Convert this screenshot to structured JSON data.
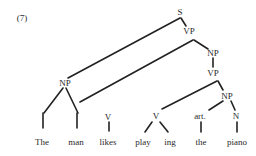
{
  "figure": {
    "number_label": "(7)",
    "ink_color": "#222222"
  },
  "nodes": {
    "s": {
      "label": "S",
      "x": 180,
      "y": 12
    },
    "vp1": {
      "label": "VP",
      "x": 189,
      "y": 31
    },
    "np1": {
      "label": "NP",
      "x": 213,
      "y": 53
    },
    "vp2": {
      "label": "VP",
      "x": 213,
      "y": 73
    },
    "np_subject": {
      "label": "NP",
      "x": 65,
      "y": 83
    },
    "v_likes": {
      "label": "V",
      "x": 108,
      "y": 117
    },
    "v_play": {
      "label": "V",
      "x": 156,
      "y": 116
    },
    "np2": {
      "label": "NP",
      "x": 227,
      "y": 96
    },
    "art": {
      "label": "art.",
      "x": 200,
      "y": 116
    },
    "n": {
      "label": "N",
      "x": 236,
      "y": 116
    }
  },
  "words": {
    "the_1": {
      "label": "The",
      "x": 42,
      "y": 142
    },
    "man": {
      "label": "man",
      "x": 76,
      "y": 142
    },
    "likes": {
      "label": "likes",
      "x": 108,
      "y": 142
    },
    "play": {
      "label": "play",
      "x": 143,
      "y": 142
    },
    "ing": {
      "label": "ing",
      "x": 170,
      "y": 142
    },
    "the_2": {
      "label": "the",
      "x": 201,
      "y": 142
    },
    "piano": {
      "label": "piano",
      "x": 237,
      "y": 142
    }
  },
  "edges": [
    {
      "from": "S",
      "to": "NP (subject)",
      "x1": 180,
      "y1": 18,
      "x2": 68,
      "y2": 78
    },
    {
      "from": "S",
      "to": "VP",
      "x1": 181,
      "y1": 18,
      "x2": 186,
      "y2": 26
    },
    {
      "from": "VP",
      "to": "man",
      "x1": 193,
      "y1": 40,
      "x2": 80,
      "y2": 102
    },
    {
      "from": "VP",
      "to": "NP",
      "x1": 194,
      "y1": 40,
      "x2": 208,
      "y2": 49
    },
    {
      "from": "NP",
      "to": "VP",
      "x1": 213,
      "y1": 58,
      "x2": 213,
      "y2": 67
    },
    {
      "from": "VP",
      "to": "V",
      "x1": 217,
      "y1": 81,
      "x2": 162,
      "y2": 109
    },
    {
      "from": "VP",
      "to": "NP",
      "x1": 218,
      "y1": 81,
      "x2": 223,
      "y2": 90
    },
    {
      "from": "NP",
      "to": "art.",
      "x1": 223,
      "y1": 101,
      "x2": 209,
      "y2": 110
    },
    {
      "from": "NP",
      "to": "N",
      "x1": 231,
      "y1": 101,
      "x2": 235,
      "y2": 110
    },
    {
      "from": "NP (subject)",
      "to": "The",
      "x1": 63,
      "y1": 88,
      "x2": 44,
      "y2": 113
    },
    {
      "from": "NP (subject)",
      "to": "man",
      "x1": 66,
      "y1": 88,
      "x2": 78,
      "y2": 113
    },
    {
      "from": "The",
      "to": "The word",
      "x1": 43,
      "y1": 113,
      "x2": 43,
      "y2": 128
    },
    {
      "from": "man",
      "to": "man word",
      "x1": 77,
      "y1": 113,
      "x2": 77,
      "y2": 128
    },
    {
      "from": "V",
      "to": "likes",
      "x1": 109,
      "y1": 122,
      "x2": 109,
      "y2": 131
    },
    {
      "from": "V",
      "to": "play",
      "x1": 152,
      "y1": 122,
      "x2": 145,
      "y2": 132
    },
    {
      "from": "V",
      "to": "ing",
      "x1": 160,
      "y1": 122,
      "x2": 168,
      "y2": 132
    },
    {
      "from": "art.",
      "to": "the",
      "x1": 201,
      "y1": 122,
      "x2": 201,
      "y2": 132
    },
    {
      "from": "N",
      "to": "piano",
      "x1": 237,
      "y1": 122,
      "x2": 237,
      "y2": 132
    }
  ]
}
